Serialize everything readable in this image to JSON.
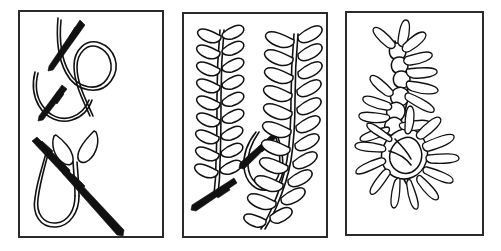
{
  "figure": {
    "background_color": "#ffffff",
    "ink_color": "#111111",
    "frame_color": "#2b2b2b",
    "panel_count": 3,
    "width": 501,
    "height": 251
  },
  "panels": [
    {
      "id": "panel-1",
      "name": "stitch-formation-steps",
      "label": "Panel 1",
      "x": 18,
      "y": 10,
      "w": 146,
      "h": 228,
      "figures": [
        {
          "id": "fig-1a",
          "name": "loop-with-needle-entering",
          "label": "Step 1: needle pierces fabric, thread held in a loop",
          "elements": [
            "thread-loop",
            "needle"
          ]
        },
        {
          "id": "fig-1b",
          "name": "completed-v-stitch-with-needle",
          "label": "Step 2: loop anchored, needle pulled through forming V arm",
          "elements": [
            "thread-loop",
            "v-arms",
            "needle"
          ]
        }
      ]
    },
    {
      "id": "panel-2",
      "name": "worked-rows-with-needle",
      "label": "Panel 2",
      "x": 182,
      "y": 12,
      "w": 146,
      "h": 226,
      "figures": [
        {
          "id": "fig-2a",
          "name": "close-feather-stitch-row",
          "label": "Dense feather stitch column, short paired leaves",
          "leaf_pairs": 9
        },
        {
          "id": "fig-2b",
          "name": "long-arm-fern-stitch-row",
          "label": "Open fern stitch column, long splayed arms, loosening toward base",
          "leaf_pairs": 11
        },
        {
          "id": "fig-2c",
          "name": "needle-in-progress",
          "label": "Needle shown mid-stitch at base of dense row",
          "elements": [
            "curved-thread-loop",
            "needle"
          ]
        }
      ]
    },
    {
      "id": "panel-3",
      "name": "radiating-spike-rosette",
      "label": "Panel 3",
      "x": 345,
      "y": 11,
      "w": 139,
      "h": 225,
      "figures": [
        {
          "id": "fig-3a",
          "name": "spiked-stitch-chain",
          "label": "Chain of knotted centers with long radiating spikes",
          "knot_centers": 3,
          "spike_count": 28
        }
      ]
    }
  ]
}
